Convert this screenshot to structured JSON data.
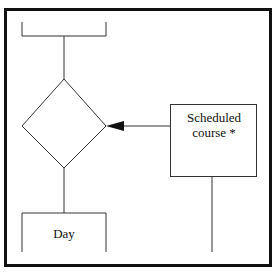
{
  "diagram": {
    "type": "entity-relationship flowchart fragment",
    "nodes": [
      {
        "id": "top-entity",
        "shape": "open-bracket",
        "label": ""
      },
      {
        "id": "relationship",
        "shape": "diamond",
        "label": ""
      },
      {
        "id": "scheduled-course",
        "shape": "rectangle",
        "label": "Scheduled course *"
      },
      {
        "id": "day",
        "shape": "open-rectangle",
        "label": "Day"
      }
    ],
    "edges": [
      {
        "from": "top-entity",
        "to": "relationship"
      },
      {
        "from": "scheduled-course",
        "to": "relationship",
        "arrow": "filled-triangle"
      },
      {
        "from": "relationship",
        "to": "day"
      }
    ],
    "labels": {
      "scheduled_line1": "Scheduled",
      "scheduled_line2": "course *",
      "day": "Day"
    },
    "colors": {
      "stroke": "#1a1a1a",
      "background": "#ffffff"
    }
  }
}
